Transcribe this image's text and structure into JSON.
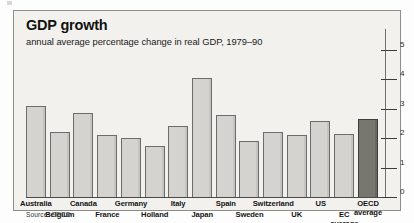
{
  "panel": {
    "title": "GDP growth",
    "subtitle": "annual average percentage change in real GDP, 1979–90",
    "source": "Source: OECD"
  },
  "chart_data": {
    "type": "bar",
    "title": "GDP growth",
    "subtitle": "annual average percentage change in real GDP, 1979–90",
    "xlabel": "",
    "ylabel": "",
    "ylim": [
      0,
      5
    ],
    "yticks": [
      0,
      1,
      2,
      3,
      4,
      5
    ],
    "ytick_labels": [
      "0",
      "1",
      "2",
      "3",
      "4",
      "5"
    ],
    "grid": false,
    "legend": false,
    "axis_side": "right",
    "source": "Source: OECD",
    "highlight_color": "#77766f",
    "bar_color": "#d4d3cf",
    "categories": [
      "Australia",
      "Belgium",
      "Canada",
      "France",
      "Germany",
      "Holland",
      "Italy",
      "Japan",
      "Spain",
      "Sweden",
      "Switzerland",
      "UK",
      "US",
      "EC average",
      "OECD average"
    ],
    "values": [
      3.1,
      2.2,
      2.85,
      2.1,
      2.0,
      1.75,
      2.4,
      4.05,
      2.8,
      1.9,
      2.2,
      2.1,
      2.6,
      2.15,
      2.65
    ],
    "highlighted": [
      "OECD average"
    ],
    "label_rows": [
      1,
      2,
      1,
      2,
      1,
      2,
      1,
      2,
      1,
      2,
      1,
      2,
      1,
      2,
      1
    ],
    "label_lines": [
      [
        "Australia"
      ],
      [
        "Belgium"
      ],
      [
        "Canada"
      ],
      [
        "France"
      ],
      [
        "Germany"
      ],
      [
        "Holland"
      ],
      [
        "Italy"
      ],
      [
        "Japan"
      ],
      [
        "Spain"
      ],
      [
        "Sweden"
      ],
      [
        "Switzerland"
      ],
      [
        "UK"
      ],
      [
        "US"
      ],
      [
        "EC",
        "average"
      ],
      [
        "OECD",
        "average"
      ]
    ]
  }
}
